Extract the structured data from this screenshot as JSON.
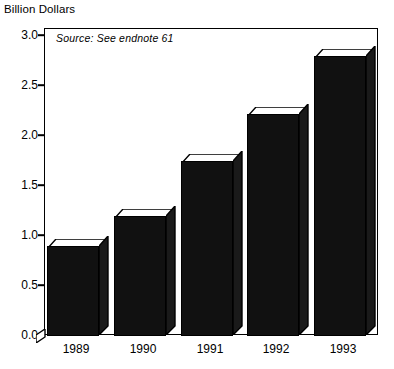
{
  "chart_data": {
    "type": "bar",
    "title": "Billion Dollars",
    "xlabel": "",
    "ylabel": "Billion Dollars",
    "categories": [
      "1989",
      "1990",
      "1991",
      "1992",
      "1993"
    ],
    "values": [
      0.9,
      1.2,
      1.75,
      2.22,
      2.8
    ],
    "ylim": [
      0.0,
      3.0
    ],
    "ytick_labels": [
      "0.0",
      "0.5",
      "1.0",
      "1.5",
      "2.0",
      "2.5",
      "3.0"
    ],
    "ytick_values": [
      0.0,
      0.5,
      1.0,
      1.5,
      2.0,
      2.5,
      3.0
    ],
    "grid": false,
    "legend": null,
    "annotations": [
      {
        "name": "source-note",
        "text": "Source: See endnote 61",
        "position": "top-left inside plot area",
        "style": "italic"
      }
    ],
    "bar_color": "#111111",
    "bar_style": "3d-extruded",
    "frame_color": "#000000",
    "background": "#ffffff"
  },
  "chart": {
    "axis_title": "Billion Dollars",
    "source_note": "Source: See endnote 61"
  }
}
